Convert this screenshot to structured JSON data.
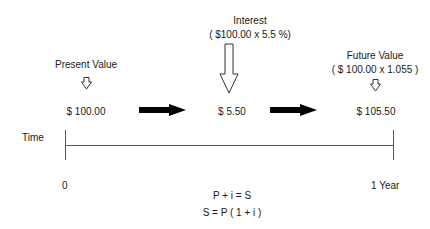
{
  "diagram": {
    "present_value": {
      "label": "Present Value",
      "amount": "$ 100.00"
    },
    "interest": {
      "label": "Interest",
      "formula": "( $100.00 x 5.5 %)",
      "amount": "$ 5.50"
    },
    "future_value": {
      "label": "Future Value",
      "formula": "( $ 100.00 x 1.055 )",
      "amount": "$ 105.50"
    },
    "timeline": {
      "label": "Time",
      "start": "0",
      "end": "1 Year"
    },
    "equations": [
      "P + i = S",
      "S = P ( 1 + i )"
    ],
    "colors": {
      "text": "#1a1a1a",
      "line": "#555555",
      "arrow_fill": "#000000",
      "hollow_arrow_stroke": "#333333"
    }
  }
}
